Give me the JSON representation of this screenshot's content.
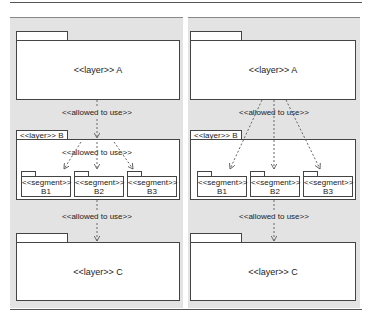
{
  "diagrams": [
    {
      "layer_a": {
        "label": "<<layer>> A"
      },
      "dependency_a_b": {
        "label": "<<allowed to use>>"
      },
      "layer_b": {
        "label": "<<layer>> B",
        "inner_dependency_label": "<<allowed to use>>",
        "segments": [
          {
            "stereotype": "<<segment>>",
            "name": "B1"
          },
          {
            "stereotype": "<<segment>>",
            "name": "B2"
          },
          {
            "stereotype": "<<segment>>",
            "name": "B3"
          }
        ]
      },
      "dependency_b_c": {
        "label": "<<allowed to use>>"
      },
      "layer_c": {
        "label": "<<layer>> C"
      }
    },
    {
      "layer_a": {
        "label": "<<layer>> A"
      },
      "dependency_a_b": {
        "label": "<<allowed to use>>"
      },
      "layer_b": {
        "label": "<<layer>> B",
        "segments": [
          {
            "stereotype": "<<segment>>",
            "name": "B1"
          },
          {
            "stereotype": "<<segment>>",
            "name": "B2"
          },
          {
            "stereotype": "<<segment>>",
            "name": "B3"
          }
        ]
      },
      "dependency_b_c": {
        "label": "<<allowed to use>>"
      },
      "layer_c": {
        "label": "<<layer>> C"
      }
    }
  ],
  "colors": {
    "panel_bg": "#e3e3e3",
    "box_fill": "#ffffff",
    "stroke": "#444444",
    "arrow": "#666666"
  }
}
